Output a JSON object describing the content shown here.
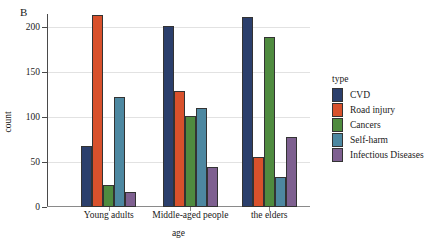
{
  "panel_label": "B",
  "chart_data": {
    "type": "bar",
    "title": "",
    "xlabel": "age",
    "ylabel": "count",
    "categories": [
      "Young adults",
      "Middle-aged people",
      "the elders"
    ],
    "ylim": [
      0,
      215
    ],
    "yticks": [
      0,
      50,
      100,
      150,
      200
    ],
    "ytick_labels": [
      "0",
      "50",
      "100",
      "150",
      "200"
    ],
    "grid": true,
    "legend_title": "type",
    "legend_position": "right",
    "series": [
      {
        "name": "CVD",
        "color": "#2b3f6c",
        "values": [
          68,
          202,
          212
        ]
      },
      {
        "name": "Road injury",
        "color": "#d8512c",
        "values": [
          214,
          129,
          56
        ]
      },
      {
        "name": "Cancers",
        "color": "#4f8b3f",
        "values": [
          24,
          101,
          189
        ]
      },
      {
        "name": "Self-harm",
        "color": "#4d88a1",
        "values": [
          122,
          110,
          33
        ]
      },
      {
        "name": "Infectious Diseases",
        "color": "#7e6090",
        "values": [
          17,
          45,
          78
        ]
      }
    ]
  }
}
